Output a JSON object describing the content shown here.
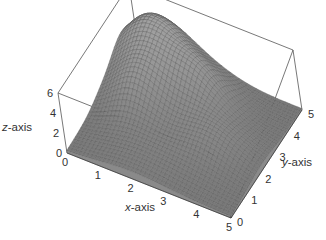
{
  "chart_data": {
    "type": "surface3d",
    "title": "",
    "xlabel_var": "x",
    "xlabel_rest": "-axis",
    "ylabel_var": "y",
    "ylabel_rest": "-axis",
    "zlabel_var": "z",
    "zlabel_rest": "-axis",
    "xlim": [
      0,
      5
    ],
    "ylim": [
      0,
      5
    ],
    "zlim": [
      0,
      6
    ],
    "xticks": [
      "0",
      "1",
      "2",
      "3",
      "4",
      "5"
    ],
    "yticks": [
      "0",
      "1",
      "2",
      "3",
      "4",
      "5"
    ],
    "zticks": [
      "0",
      "2",
      "4",
      "6"
    ],
    "surface": {
      "description": "Sum of Gaussian bumps over [0,5]x[0,5]; tallest peak near x≈1, y≈4 (z≈5.5), secondary bumps near (2.5,3.5), (1,2.5), (3.5,2); low flat region near y≈0",
      "bumps": [
        {
          "x": 1.0,
          "y": 4.2,
          "height": 5.5,
          "spread": 0.9
        },
        {
          "x": 2.6,
          "y": 3.6,
          "height": 3.2,
          "spread": 0.7
        },
        {
          "x": 1.2,
          "y": 2.5,
          "height": 2.8,
          "spread": 0.7
        },
        {
          "x": 3.6,
          "y": 2.2,
          "height": 2.0,
          "spread": 0.8
        },
        {
          "x": 2.0,
          "y": 1.0,
          "height": 1.0,
          "spread": 1.0
        }
      ],
      "grid_resolution": 40,
      "color": "#555555"
    },
    "grid": false,
    "legend": "none",
    "box": true
  }
}
